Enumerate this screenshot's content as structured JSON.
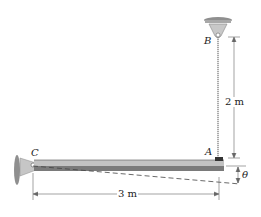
{
  "diagram": {
    "type": "mechanics-figure",
    "points": {
      "B": "B",
      "A": "A",
      "C": "C"
    },
    "dimensions": {
      "vertical_length": "2 m",
      "horizontal_length": "3 m",
      "angle": "θ"
    },
    "colors": {
      "beam_top": "#bdbdbd",
      "beam_bottom": "#6e6e6e",
      "support": "#9a9a9a",
      "line": "#555555"
    }
  }
}
